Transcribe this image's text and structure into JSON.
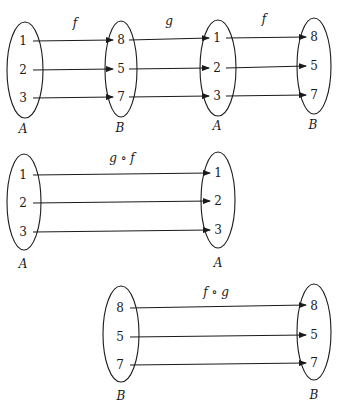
{
  "diagrams": [
    {
      "name": "chain-f-g-f",
      "sets": [
        {
          "label": "A",
          "elements": [
            "1",
            "2",
            "3"
          ]
        },
        {
          "label": "B",
          "elements": [
            "8",
            "5",
            "7"
          ]
        },
        {
          "label": "A",
          "elements": [
            "1",
            "2",
            "3"
          ]
        },
        {
          "label": "B",
          "elements": [
            "8",
            "5",
            "7"
          ]
        }
      ],
      "maps": [
        "f",
        "g",
        "f"
      ]
    },
    {
      "name": "g-compose-f",
      "sets": [
        {
          "label": "A",
          "elements": [
            "1",
            "2",
            "3"
          ]
        },
        {
          "label": "A",
          "elements": [
            "1",
            "2",
            "3"
          ]
        }
      ],
      "maps": [
        "g ∘ f"
      ]
    },
    {
      "name": "f-compose-g",
      "sets": [
        {
          "label": "B",
          "elements": [
            "8",
            "5",
            "7"
          ]
        },
        {
          "label": "B",
          "elements": [
            "8",
            "5",
            "7"
          ]
        }
      ],
      "maps": [
        "f ∘ g"
      ]
    }
  ]
}
